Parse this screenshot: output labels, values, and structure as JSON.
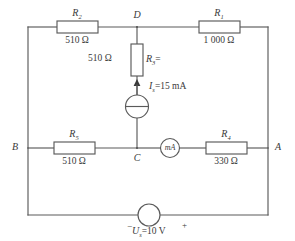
{
  "diagram": {
    "line_color": "#5a5a5a",
    "text_color": "#3a3a3a",
    "background": "#ffffff"
  },
  "nodes": [
    {
      "id": "A",
      "label": "A"
    },
    {
      "id": "B",
      "label": "B"
    },
    {
      "id": "C",
      "label": "C"
    },
    {
      "id": "D",
      "label": "D"
    }
  ],
  "components": {
    "r1": {
      "ref": "R",
      "subscript": "1",
      "value": "1 000 Ω",
      "position": "top-right"
    },
    "r2": {
      "ref": "R",
      "subscript": "2",
      "value": "510 Ω",
      "position": "top-left"
    },
    "r3": {
      "ref": "R",
      "subscript": "3",
      "ref_suffix": "=",
      "value": "510 Ω",
      "position": "center-vertical"
    },
    "r4": {
      "ref": "R",
      "subscript": "4",
      "value": "330 Ω",
      "position": "middle-right"
    },
    "r5": {
      "ref": "R",
      "subscript": "5",
      "value": "510 Ω",
      "position": "middle-left"
    },
    "current_source": {
      "ref": "I",
      "subscript": "s",
      "value": "=15 mA",
      "full_label": "Iₛ=15 mA",
      "symbol": "circle-with-bar"
    },
    "voltage_source": {
      "ref": "U",
      "subscript": "s",
      "value": "=10 V",
      "full_label": "Uₛ=10 V",
      "minus": "−",
      "plus": "+",
      "symbol": "circle"
    },
    "ammeter": {
      "label": "mA",
      "name": "milliammeter"
    }
  }
}
